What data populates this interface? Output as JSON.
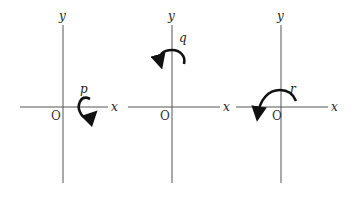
{
  "figure": {
    "panels": [
      {
        "id": "p",
        "x_label": "x",
        "y_label": "y",
        "origin_label": "O",
        "rotation_label": "p",
        "rotation_location": "on positive x-axis",
        "direction": "clockwise (about y-axis view)"
      },
      {
        "id": "q",
        "x_label": "x",
        "y_label": "y",
        "origin_label": "O",
        "rotation_label": "q",
        "rotation_location": "on positive y-axis",
        "direction": "counterclockwise"
      },
      {
        "id": "r",
        "x_label": "x",
        "y_label": "y",
        "origin_label": "O",
        "rotation_label": "r",
        "rotation_location": "around origin, top half",
        "direction": "counterclockwise"
      }
    ],
    "colors": {
      "axis": "#555555",
      "arrow": "#111111",
      "background": "#ffffff"
    }
  }
}
